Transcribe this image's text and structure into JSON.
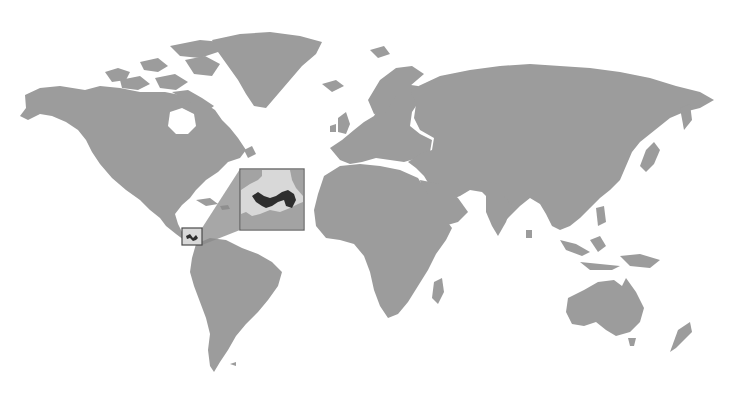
{
  "map": {
    "type": "world-locator-map",
    "highlighted_country": "Panama",
    "colors": {
      "background": "#ffffff",
      "land": "#9c9c9c",
      "highlight": "#2e2e2e",
      "inset_background": "#d8d8d8",
      "inset_border": "#6a6a6a"
    },
    "locator_box": {
      "x": 182,
      "y": 228,
      "width": 20,
      "height": 17
    },
    "inset": {
      "x": 240,
      "y": 169,
      "width": 64,
      "height": 61
    }
  }
}
